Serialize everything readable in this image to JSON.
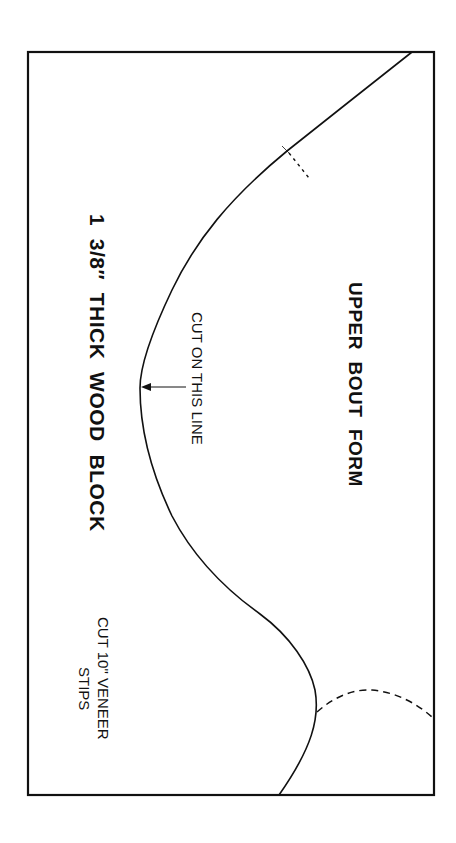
{
  "diagram": {
    "title_label": "UPPER  BOUT  FORM",
    "block_label": "1  3/8″  THICK  WOOD  BLOCK",
    "cut_line_label": "CUT ON THIS LINE",
    "veneer_label_line1": "CUT 10\" VENEER",
    "veneer_label_line2": "STIPS",
    "stroke_color": "#111111",
    "background_color": "#ffffff",
    "frame": {
      "x": 28,
      "y": 52,
      "width": 406,
      "height": 743
    }
  }
}
